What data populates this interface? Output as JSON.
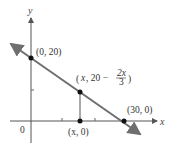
{
  "diagram": {
    "type": "coordinate-graph",
    "axes": {
      "x_label": "x",
      "y_label": "y",
      "origin_label": "0"
    },
    "points": {
      "y_intercept": {
        "label": "(0, 20)",
        "x": 0,
        "y": 20
      },
      "x_intercept": {
        "label": "(30, 0)",
        "x": 30,
        "y": 0
      },
      "foot": {
        "label": "(x, 0)"
      },
      "on_line": {
        "label_prefix": "(x, 20 −",
        "frac_num": "2x",
        "frac_den": "3",
        "label_suffix": ")"
      }
    },
    "line": {
      "equation": "y = 20 - 2x/3",
      "color": "#6e6e6e"
    },
    "colors": {
      "axis": "#555555",
      "line": "#6e6e6e",
      "point": "#111111",
      "text": "#333333"
    }
  }
}
